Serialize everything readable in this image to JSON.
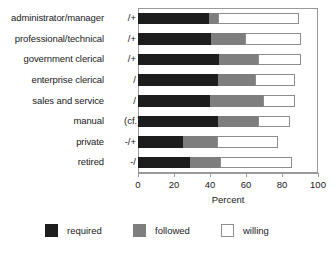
{
  "chart_data": {
    "type": "bar",
    "orientation": "horizontal",
    "stacked": true,
    "title": "",
    "xlabel": "Percent",
    "ylabel": "",
    "xlim": [
      0,
      100
    ],
    "xticks": [
      0,
      20,
      40,
      60,
      80,
      100
    ],
    "grid": false,
    "legend_position": "bottom",
    "categories": [
      "administrator/manager",
      "professional/technical",
      "government clerical",
      "enterprise clerical",
      "sales and service",
      "manual (cf.)",
      "private -/+",
      "retired -/"
    ],
    "category_suffixes": [
      "/+",
      "/+",
      "/+",
      "/",
      "/",
      "",
      "",
      ""
    ],
    "category_labels": [
      "administrator/manager",
      "professional/technical",
      "government clerical",
      "enterprise clerical",
      "sales and service",
      "manual (cf.)",
      "private -/+",
      "retired -/"
    ],
    "series": [
      {
        "name": "required",
        "color": "#1d1d1d",
        "values": [
          39.4,
          40.6,
          45.0,
          44.4,
          40.0,
          44.4,
          25.0,
          28.9
        ]
      },
      {
        "name": "followed",
        "color": "#7e7e7e",
        "values": [
          5.0,
          18.8,
          21.7,
          20.6,
          29.4,
          22.3,
          19.0,
          16.7
        ]
      },
      {
        "name": "willing",
        "color": "#ffffff",
        "values": [
          45.0,
          31.1,
          23.8,
          22.2,
          17.8,
          17.7,
          33.8,
          40.0
        ]
      }
    ],
    "cumulative_ends": [
      [
        39.4,
        44.4,
        89.4
      ],
      [
        40.6,
        59.4,
        90.5
      ],
      [
        45.0,
        66.7,
        90.5
      ],
      [
        44.4,
        65.0,
        87.2
      ],
      [
        40.0,
        69.4,
        87.2
      ],
      [
        44.4,
        66.7,
        84.4
      ],
      [
        25.0,
        44.0,
        77.8
      ],
      [
        28.9,
        45.6,
        85.6
      ]
    ],
    "legend": [
      {
        "label": "required",
        "color": "#1d1d1d"
      },
      {
        "label": "followed",
        "color": "#7e7e7e"
      },
      {
        "label": "willing",
        "color": "#ffffff"
      }
    ],
    "tick_labels": [
      "0",
      "20",
      "40",
      "60",
      "80",
      "100"
    ]
  }
}
